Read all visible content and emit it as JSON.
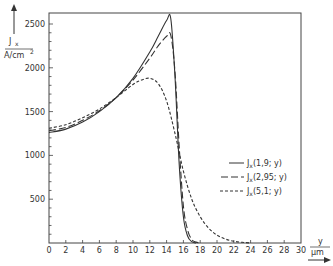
{
  "chart_data": {
    "type": "line",
    "title": "",
    "ylabel_top": "J",
    "ylabel_sub": "x",
    "ylabel_unit": "A/cm",
    "ylabel_unit_sup": "2",
    "xlabel_top": "y",
    "xlabel_unit": "µm",
    "xlim": [
      0,
      30
    ],
    "ylim": [
      0,
      2600
    ],
    "xticks": [
      "0",
      "2",
      "4",
      "6",
      "8",
      "10",
      "12",
      "14",
      "16",
      "18",
      "20",
      "22",
      "24",
      "26",
      "28",
      "30"
    ],
    "yticks": [
      "500",
      "1000",
      "1500",
      "2000",
      "2500"
    ],
    "grid": false,
    "legend_position": "right-middle",
    "series": [
      {
        "name": "Jx(1,9; y)",
        "legend_label": "J",
        "legend_sub": "x",
        "legend_arg": "(1,9; y)",
        "style": "solid",
        "x": [
          0,
          2,
          4,
          6,
          8,
          10,
          12,
          13,
          14,
          14.5,
          15,
          15.5,
          16,
          16.5,
          17,
          17.5
        ],
        "y": [
          1260,
          1300,
          1380,
          1500,
          1660,
          1880,
          2180,
          2360,
          2540,
          2560,
          1900,
          900,
          300,
          80,
          15,
          0
        ]
      },
      {
        "name": "Jx(2,95; y)",
        "legend_label": "J",
        "legend_sub": "x",
        "legend_arg": "(2,95; y)",
        "style": "dashed",
        "x": [
          0,
          2,
          4,
          6,
          8,
          10,
          12,
          13,
          14,
          14.5,
          15,
          15.5,
          16,
          16.5,
          17,
          17.5,
          18
        ],
        "y": [
          1280,
          1320,
          1400,
          1510,
          1660,
          1860,
          2110,
          2250,
          2360,
          2370,
          1950,
          1100,
          420,
          150,
          40,
          10,
          0
        ]
      },
      {
        "name": "Jx(5,1; y)",
        "legend_label": "J",
        "legend_sub": "x",
        "legend_arg": "(5,1; y)",
        "style": "dotted-dash",
        "x": [
          0,
          2,
          4,
          6,
          8,
          10,
          11,
          12,
          13,
          14,
          15,
          16,
          17,
          18,
          19,
          20,
          21,
          22,
          23,
          24
        ],
        "y": [
          1310,
          1350,
          1430,
          1530,
          1660,
          1810,
          1860,
          1880,
          1820,
          1620,
          1250,
          820,
          500,
          300,
          170,
          90,
          45,
          20,
          8,
          0
        ]
      }
    ]
  }
}
